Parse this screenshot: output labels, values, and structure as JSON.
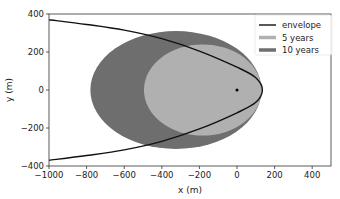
{
  "chart_data": {
    "type": "area",
    "title": "",
    "xlabel": "x (m)",
    "ylabel": "y (m)",
    "xlim": [
      -1000,
      500
    ],
    "ylim": [
      -400,
      400
    ],
    "xticks": [
      -1000,
      -800,
      -600,
      -400,
      -200,
      0,
      200,
      400
    ],
    "yticks": [
      -400,
      -200,
      0,
      200,
      400
    ],
    "xtick_labels": [
      "−1000",
      "−800",
      "−600",
      "−400",
      "−200",
      "0",
      "200",
      "400"
    ],
    "ytick_labels": [
      "−400",
      "−200",
      "0",
      "200",
      "400"
    ],
    "grid": false,
    "legend_position": "upper right",
    "series": [
      {
        "name": "envelope",
        "kind": "line",
        "color": "#111111",
        "description": "parabola-like boundary opening to the left, apex near x=135, y=0; half-width about 370 at x=-1000",
        "points": [
          [
            -1000,
            370
          ],
          [
            -800,
            345
          ],
          [
            -600,
            315
          ],
          [
            -400,
            270
          ],
          [
            -200,
            205
          ],
          [
            0,
            120
          ],
          [
            100,
            65
          ],
          [
            135,
            0
          ],
          [
            100,
            -65
          ],
          [
            0,
            -120
          ],
          [
            -200,
            -205
          ],
          [
            -400,
            -270
          ],
          [
            -600,
            -315
          ],
          [
            -800,
            -345
          ],
          [
            -1000,
            -370
          ]
        ]
      },
      {
        "name": "5 years",
        "kind": "filled-ellipse",
        "color": "#b0b0b0",
        "x_range": [
          -495,
          130
        ],
        "y_range": [
          -240,
          240
        ],
        "center": [
          -182,
          0
        ]
      },
      {
        "name": "10 years",
        "kind": "filled-ellipse",
        "color": "#6e6e6e",
        "x_range": [
          -780,
          130
        ],
        "y_range": [
          -310,
          310
        ],
        "center": [
          -325,
          0
        ]
      }
    ],
    "annotations": [
      {
        "kind": "point",
        "x": 0,
        "y": 0,
        "color": "#000000"
      }
    ]
  }
}
